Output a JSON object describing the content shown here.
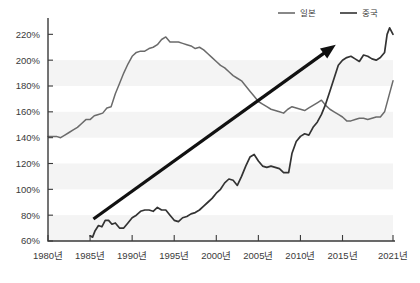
{
  "chart_data": {
    "type": "line",
    "title": "",
    "subtitle": "",
    "xlabel": "",
    "ylabel": "",
    "ylim": [
      60,
      228
    ],
    "xlim": [
      1980,
      2021
    ],
    "grid": false,
    "y_ticks": [
      "60%",
      "80%",
      "100%",
      "120%",
      "140%",
      "160%",
      "180%",
      "200%",
      "220%"
    ],
    "y_tick_values": [
      60,
      80,
      100,
      120,
      140,
      160,
      180,
      200,
      220
    ],
    "x_ticks": [
      "1980년",
      "1985년",
      "1990년",
      "1995년",
      "2000년",
      "2005년",
      "2010년",
      "2015년",
      "2021년"
    ],
    "x_tick_values": [
      1980,
      1985,
      1990,
      1995,
      2000,
      2005,
      2010,
      2015,
      2021
    ],
    "legend_position": "top-right",
    "legend": [
      {
        "name": "일본",
        "color": "#6b6b6b"
      },
      {
        "name": "중국",
        "color": "#333333"
      }
    ],
    "annotations": [
      {
        "type": "arrow",
        "label": "",
        "x_start": 1985.4,
        "y_start": 77,
        "x_end": 2014.2,
        "y_end": 212,
        "color": "#111111"
      }
    ],
    "series": [
      {
        "name": "일본",
        "color": "#6b6b6b",
        "x": [
          1980.0,
          1980.5,
          1981.0,
          1981.5,
          1982.0,
          1982.5,
          1983.0,
          1983.5,
          1984.0,
          1984.5,
          1985.0,
          1985.5,
          1986.0,
          1986.5,
          1987.0,
          1987.5,
          1988.0,
          1988.5,
          1989.0,
          1989.5,
          1990.0,
          1990.5,
          1991.0,
          1991.5,
          1992.0,
          1992.5,
          1993.0,
          1993.5,
          1994.0,
          1994.5,
          1995.0,
          1995.5,
          1996.0,
          1996.5,
          1997.0,
          1997.5,
          1998.0,
          1998.5,
          1999.0,
          1999.5,
          2000.0,
          2000.5,
          2001.0,
          2001.5,
          2002.0,
          2002.5,
          2003.0,
          2003.5,
          2004.0,
          2004.5,
          2005.0,
          2005.5,
          2006.0,
          2006.5,
          2007.0,
          2007.5,
          2008.0,
          2008.5,
          2009.0,
          2009.5,
          2010.0,
          2010.5,
          2011.0,
          2011.5,
          2012.0,
          2012.5,
          2013.0,
          2013.5,
          2014.0,
          2014.5,
          2015.0,
          2015.5,
          2016.0,
          2016.5,
          2017.0,
          2017.5,
          2018.0,
          2018.5,
          2019.0,
          2019.5,
          2020.0,
          2020.5,
          2021.0
        ],
        "values": [
          141,
          141,
          141,
          140,
          142,
          144,
          146,
          148,
          151,
          154,
          154,
          157,
          158,
          159,
          163,
          164,
          174,
          182,
          190,
          197,
          203,
          206,
          207,
          207,
          209,
          210,
          212,
          216,
          218,
          214,
          214,
          214,
          213,
          212,
          211,
          209,
          210,
          208,
          205,
          202,
          199,
          196,
          194,
          191,
          188,
          186,
          184,
          180,
          176,
          172,
          168,
          166,
          164,
          162,
          161,
          160,
          159,
          162,
          164,
          163,
          162,
          161,
          163,
          165,
          167,
          169,
          165,
          162,
          160,
          158,
          156,
          153,
          153,
          154,
          155,
          155,
          154,
          155,
          156,
          156,
          160,
          172,
          184
        ]
      },
      {
        "name": "중국",
        "color": "#333333",
        "x": [
          1985.0,
          1985.3,
          1985.6,
          1986.0,
          1986.4,
          1986.8,
          1987.2,
          1987.6,
          1988.0,
          1988.5,
          1989.0,
          1989.5,
          1990.0,
          1990.5,
          1991.0,
          1991.5,
          1992.0,
          1992.5,
          1993.0,
          1993.5,
          1994.0,
          1994.5,
          1995.0,
          1995.5,
          1996.0,
          1996.5,
          1997.0,
          1997.5,
          1998.0,
          1998.5,
          1999.0,
          1999.5,
          2000.0,
          2000.5,
          2001.0,
          2001.5,
          2002.0,
          2002.5,
          2003.0,
          2003.5,
          2004.0,
          2004.5,
          2005.0,
          2005.5,
          2006.0,
          2006.5,
          2007.0,
          2007.5,
          2008.0,
          2008.3,
          2008.6,
          2009.0,
          2009.5,
          2010.0,
          2010.5,
          2011.0,
          2011.5,
          2012.0,
          2012.5,
          2013.0,
          2013.5,
          2014.0,
          2014.5,
          2015.0,
          2015.5,
          2016.0,
          2016.5,
          2017.0,
          2017.5,
          2018.0,
          2018.5,
          2019.0,
          2019.5,
          2020.0,
          2020.3,
          2020.6,
          2021.0
        ],
        "values": [
          64,
          63,
          68,
          72,
          71,
          76,
          76,
          73,
          74,
          70,
          70,
          74,
          78,
          80,
          83,
          84,
          84,
          83,
          86,
          84,
          84,
          80,
          76,
          75,
          78,
          79,
          81,
          82,
          84,
          87,
          90,
          93,
          97,
          100,
          105,
          108,
          107,
          103,
          110,
          118,
          125,
          127,
          122,
          118,
          117,
          118,
          117,
          116,
          113,
          113,
          113,
          128,
          137,
          141,
          143,
          142,
          148,
          152,
          158,
          166,
          176,
          186,
          196,
          200,
          202,
          203,
          201,
          199,
          204,
          203,
          201,
          200,
          202,
          206,
          220,
          225,
          220
        ]
      }
    ]
  },
  "legend": {
    "japan_label": "일본",
    "china_label": "중국"
  }
}
